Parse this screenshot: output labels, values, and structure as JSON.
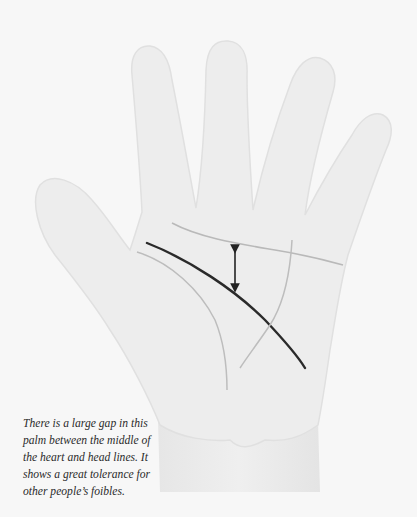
{
  "diagram": {
    "lines": [
      {
        "name": "heart line",
        "color": "#b9b9b9",
        "emphasis": "faint"
      },
      {
        "name": "head line",
        "color": "#2a2a2a",
        "emphasis": "highlighted"
      },
      {
        "name": "life line",
        "color": "#bdbdbd",
        "emphasis": "faint"
      },
      {
        "name": "fate line",
        "color": "#bdbdbd",
        "emphasis": "faint"
      }
    ],
    "annotation": "double-headed arrow marking gap between heart and head lines"
  },
  "caption": {
    "lines": [
      "There is a large gap in this",
      "palm between the middle of",
      "the heart and head lines. It",
      "shows a great tolerance for",
      "other people’s foibles."
    ]
  },
  "colors": {
    "background": "#f7f7f7",
    "skin": "#ededed",
    "outline": "#e2e2e2",
    "head_line": "#2a2a2a",
    "faint_lines": "#b9b9b9",
    "arrow": "#222222"
  }
}
